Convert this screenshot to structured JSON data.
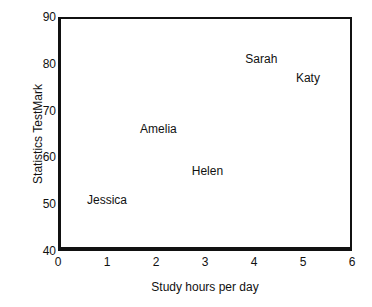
{
  "chart_data": {
    "type": "scatter",
    "title": "",
    "xlabel": "Study hours per day",
    "ylabel": "Statistics TestMark",
    "xlim": [
      0,
      6
    ],
    "ylim": [
      40,
      90
    ],
    "xticks": [
      "0",
      "1",
      "2",
      "3",
      "4",
      "5",
      "6"
    ],
    "yticks": [
      "40",
      "50",
      "60",
      "70",
      "80",
      "90"
    ],
    "grid": false,
    "legend": "none",
    "marker_style": "text-label-only",
    "points": [
      {
        "label": "Jessica",
        "x": 1.0,
        "y": 51
      },
      {
        "label": "Amelia",
        "x": 2.05,
        "y": 66
      },
      {
        "label": "Helen",
        "x": 3.05,
        "y": 57
      },
      {
        "label": "Sarah",
        "x": 4.15,
        "y": 81
      },
      {
        "label": "Katy",
        "x": 5.1,
        "y": 77
      }
    ],
    "colors": {
      "axis": "#111111",
      "text": "#111111",
      "background": "#ffffff"
    }
  }
}
